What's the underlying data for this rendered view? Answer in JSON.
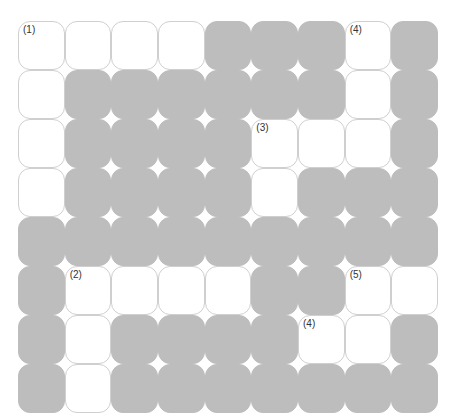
{
  "puzzle": {
    "type": "crossword-grid",
    "columns": 9,
    "rows": 8,
    "colors": {
      "white_cell": "#ffffff",
      "block_cell": "#bdbdbd",
      "cell_border": "#cfcfcf",
      "number_text": "#333333"
    },
    "legend": {
      "W": "white (fillable) cell",
      "B": "gray (blocked) cell"
    },
    "grid": [
      [
        "W",
        "W",
        "W",
        "W",
        "B",
        "B",
        "B",
        "W",
        "B"
      ],
      [
        "W",
        "B",
        "B",
        "B",
        "B",
        "B",
        "B",
        "W",
        "B"
      ],
      [
        "W",
        "B",
        "B",
        "B",
        "B",
        "W",
        "W",
        "W",
        "B"
      ],
      [
        "W",
        "B",
        "B",
        "B",
        "B",
        "W",
        "B",
        "B",
        "B"
      ],
      [
        "B",
        "B",
        "B",
        "B",
        "B",
        "B",
        "B",
        "B",
        "B"
      ],
      [
        "B",
        "W",
        "W",
        "W",
        "W",
        "B",
        "B",
        "W",
        "W"
      ],
      [
        "B",
        "W",
        "B",
        "B",
        "B",
        "B",
        "W",
        "W",
        "B"
      ],
      [
        "B",
        "W",
        "B",
        "B",
        "B",
        "B",
        "B",
        "B",
        "B"
      ]
    ],
    "clue_numbers": [
      {
        "row": 0,
        "col": 0,
        "label": "(1)"
      },
      {
        "row": 0,
        "col": 7,
        "label": "(4)"
      },
      {
        "row": 2,
        "col": 5,
        "label": "(3)"
      },
      {
        "row": 5,
        "col": 1,
        "label": "(2)"
      },
      {
        "row": 5,
        "col": 7,
        "label": "(5)"
      },
      {
        "row": 6,
        "col": 6,
        "label": "(4)"
      }
    ]
  }
}
